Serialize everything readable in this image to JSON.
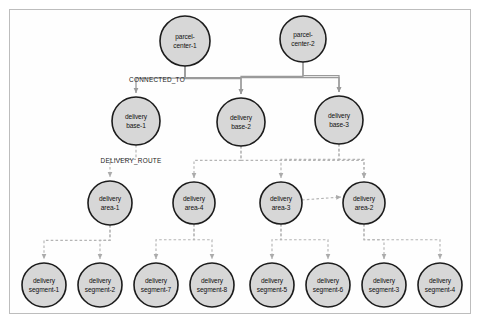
{
  "diagram": {
    "type": "graph-node-link",
    "colors": {
      "node_fill": "#d7d7d7",
      "node_stroke": "#1c1c1c",
      "edge_solid": "#9a9a9a",
      "edge_dashed": "#b4b4b4",
      "frame": "#bdbdbd",
      "background": "#ffffff",
      "text": "#111111"
    },
    "relationship_labels": [
      {
        "id": "rel-connected-to",
        "text": "CONNECTED_TO",
        "x": 157,
        "y": 82,
        "style": "solid"
      },
      {
        "id": "rel-delivery-route",
        "text": "DELIVERY_ROUTE",
        "x": 131,
        "y": 163,
        "style": "dashed"
      }
    ],
    "nodes": [
      {
        "id": "parcel-center-1",
        "line1": "parcel-",
        "line2": "center-1",
        "cx": 185,
        "cy": 41,
        "r": 25,
        "tier": "parcel-center"
      },
      {
        "id": "parcel-center-2",
        "line1": "parcel-",
        "line2": "center-2",
        "cx": 303,
        "cy": 39,
        "r": 23,
        "tier": "parcel-center"
      },
      {
        "id": "delivery-base-1",
        "line1": "delivery",
        "line2": "base-1",
        "cx": 136,
        "cy": 121,
        "r": 24,
        "tier": "delivery-base"
      },
      {
        "id": "delivery-base-2",
        "line1": "delivery",
        "line2": "base-2",
        "cx": 241,
        "cy": 122,
        "r": 24,
        "tier": "delivery-base"
      },
      {
        "id": "delivery-base-3",
        "line1": "delivery",
        "line2": "base-3",
        "cx": 339,
        "cy": 120,
        "r": 24,
        "tier": "delivery-base"
      },
      {
        "id": "delivery-area-1",
        "line1": "delivery",
        "line2": "area-1",
        "cx": 110,
        "cy": 203,
        "r": 22,
        "tier": "delivery-area"
      },
      {
        "id": "delivery-area-4",
        "line1": "delivery",
        "line2": "area-4",
        "cx": 194,
        "cy": 203,
        "r": 21,
        "tier": "delivery-area"
      },
      {
        "id": "delivery-area-3",
        "line1": "delivery",
        "line2": "area-3",
        "cx": 281,
        "cy": 203,
        "r": 21,
        "tier": "delivery-area"
      },
      {
        "id": "delivery-area-2",
        "line1": "delivery",
        "line2": "area-2",
        "cx": 364,
        "cy": 203,
        "r": 21,
        "tier": "delivery-area"
      },
      {
        "id": "delivery-segment-1",
        "line1": "delivery",
        "line2": "segment-1",
        "cx": 44,
        "cy": 285,
        "r": 22,
        "tier": "delivery-segment"
      },
      {
        "id": "delivery-segment-2",
        "line1": "delivery",
        "line2": "segment-2",
        "cx": 100,
        "cy": 285,
        "r": 22,
        "tier": "delivery-segment"
      },
      {
        "id": "delivery-segment-7",
        "line1": "delivery",
        "line2": "segment-7",
        "cx": 156,
        "cy": 285,
        "r": 22,
        "tier": "delivery-segment"
      },
      {
        "id": "delivery-segment-8",
        "line1": "delivery",
        "line2": "segment-8",
        "cx": 212,
        "cy": 285,
        "r": 22,
        "tier": "delivery-segment"
      },
      {
        "id": "delivery-segment-5",
        "line1": "delivery",
        "line2": "segment-5",
        "cx": 272,
        "cy": 285,
        "r": 22,
        "tier": "delivery-segment"
      },
      {
        "id": "delivery-segment-6",
        "line1": "delivery",
        "line2": "segment-6",
        "cx": 328,
        "cy": 285,
        "r": 22,
        "tier": "delivery-segment"
      },
      {
        "id": "delivery-segment-3",
        "line1": "delivery",
        "line2": "segment-3",
        "cx": 384,
        "cy": 285,
        "r": 22,
        "tier": "delivery-segment"
      },
      {
        "id": "delivery-segment-4",
        "line1": "delivery",
        "line2": "segment-4",
        "cx": 440,
        "cy": 285,
        "r": 22,
        "tier": "delivery-segment"
      }
    ],
    "edges": [
      {
        "from": "parcel-center-1",
        "to": "delivery-base-1",
        "type": "CONNECTED_TO",
        "style": "solid"
      },
      {
        "from": "parcel-center-1",
        "to": "delivery-base-2",
        "type": "CONNECTED_TO",
        "style": "solid"
      },
      {
        "from": "parcel-center-1",
        "to": "delivery-base-3",
        "type": "CONNECTED_TO",
        "style": "solid"
      },
      {
        "from": "parcel-center-2",
        "to": "delivery-base-2",
        "type": "CONNECTED_TO",
        "style": "solid"
      },
      {
        "from": "parcel-center-2",
        "to": "delivery-base-3",
        "type": "CONNECTED_TO",
        "style": "solid"
      },
      {
        "from": "delivery-base-1",
        "to": "delivery-area-1",
        "type": "DELIVERY_ROUTE",
        "style": "dashed"
      },
      {
        "from": "delivery-base-2",
        "to": "delivery-area-4",
        "type": "DELIVERY_ROUTE",
        "style": "dashed"
      },
      {
        "from": "delivery-base-2",
        "to": "delivery-area-2",
        "type": "DELIVERY_ROUTE",
        "style": "dashed"
      },
      {
        "from": "delivery-base-3",
        "to": "delivery-area-3",
        "type": "DELIVERY_ROUTE",
        "style": "dashed"
      },
      {
        "from": "delivery-base-3",
        "to": "delivery-area-2",
        "type": "DELIVERY_ROUTE",
        "style": "dashed"
      },
      {
        "from": "delivery-area-1",
        "to": "delivery-segment-1",
        "type": "DELIVERY_ROUTE",
        "style": "dashed"
      },
      {
        "from": "delivery-area-1",
        "to": "delivery-segment-2",
        "type": "DELIVERY_ROUTE",
        "style": "dashed"
      },
      {
        "from": "delivery-area-4",
        "to": "delivery-segment-7",
        "type": "DELIVERY_ROUTE",
        "style": "dashed"
      },
      {
        "from": "delivery-area-4",
        "to": "delivery-segment-8",
        "type": "DELIVERY_ROUTE",
        "style": "dashed"
      },
      {
        "from": "delivery-area-3",
        "to": "delivery-segment-5",
        "type": "DELIVERY_ROUTE",
        "style": "dashed"
      },
      {
        "from": "delivery-area-3",
        "to": "delivery-segment-6",
        "type": "DELIVERY_ROUTE",
        "style": "dashed"
      },
      {
        "from": "delivery-area-3",
        "to": "delivery-area-2",
        "type": "DELIVERY_ROUTE",
        "style": "dashed"
      },
      {
        "from": "delivery-area-2",
        "to": "delivery-segment-3",
        "type": "DELIVERY_ROUTE",
        "style": "dashed"
      },
      {
        "from": "delivery-area-2",
        "to": "delivery-segment-4",
        "type": "DELIVERY_ROUTE",
        "style": "dashed"
      }
    ]
  }
}
